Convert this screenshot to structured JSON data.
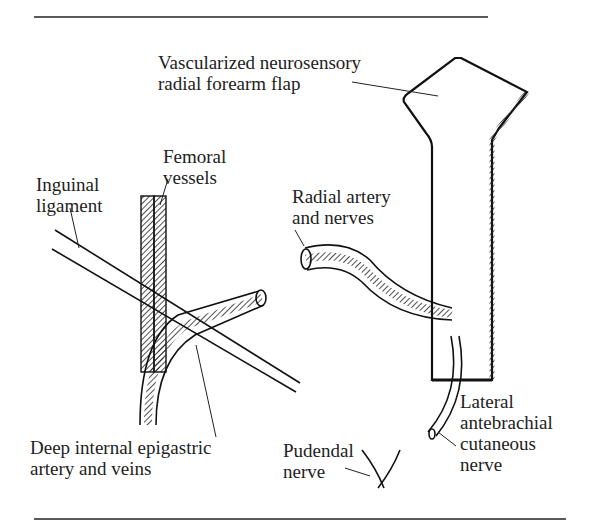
{
  "figure": {
    "labels": {
      "flap": [
        "Vascularized neurosensory",
        "radial forearm flap"
      ],
      "inguinal": [
        "Inguinal",
        "ligament"
      ],
      "femoral": [
        "Femoral",
        "vessels"
      ],
      "radial": [
        "Radial artery",
        "and nerves"
      ],
      "epigastric": [
        "Deep internal epigastric",
        "artery and veins"
      ],
      "pudendal": [
        "Pudendal",
        "nerve"
      ],
      "lateral": [
        "Lateral",
        "antebrachial",
        "cutaneous",
        "nerve"
      ]
    },
    "colors": {
      "ink": "#1a1a1a",
      "background": "#ffffff"
    }
  }
}
